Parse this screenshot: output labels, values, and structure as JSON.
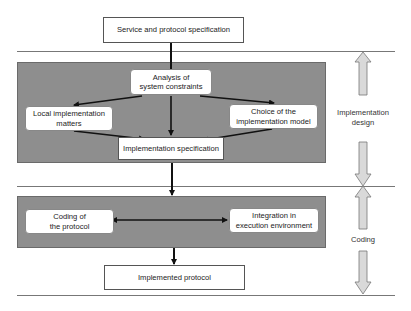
{
  "diagram": {
    "top_box": "Service and protocol specification",
    "design_panel": {
      "analysis": {
        "line1": "Analysis of",
        "line2": "system constraints"
      },
      "local": {
        "line1": "Local implementation",
        "line2": "matters"
      },
      "choice": {
        "line1": "Choice of the",
        "line2": "implementation model"
      },
      "spec": "Implementation specification"
    },
    "coding_panel": {
      "coding": {
        "line1": "Coding of",
        "line2": "the protocol"
      },
      "integration": {
        "line1": "Integration in",
        "line2": "execution environment"
      }
    },
    "bottom_box": "Implemented protocol",
    "phases": {
      "design": {
        "line1": "Implementation",
        "line2": "design"
      },
      "coding": "Coding"
    },
    "colors": {
      "panel": "#8e8e8e",
      "box": "#ffffff",
      "arrow": "#111111",
      "phase_arrow_fill": "#d9d9d9",
      "phase_arrow_stroke": "#777777"
    }
  }
}
